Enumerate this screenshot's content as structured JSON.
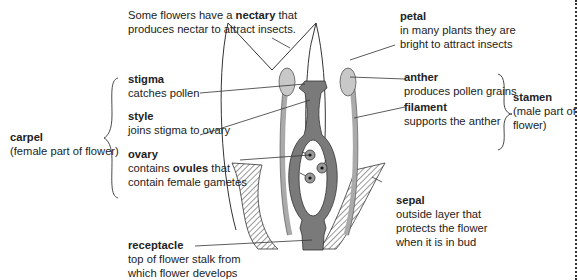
{
  "diagram": {
    "labels": {
      "nectary_note": {
        "pre": "Some flowers have a ",
        "bold": "nectary",
        "post": " that",
        "line2": "produces nectar to attract insects."
      },
      "petal": {
        "name": "petal",
        "desc1": "in many plants they are",
        "desc2": "bright to attract insects"
      },
      "stigma": {
        "name": "stigma",
        "desc": "catches pollen"
      },
      "style": {
        "name": "style",
        "desc": "joins stigma to ovary"
      },
      "carpel": {
        "name": "carpel",
        "desc": "(female part of flower)"
      },
      "ovary": {
        "name": "ovary",
        "desc_pre": "contains ",
        "desc_bold": "ovules",
        "desc_post": " that",
        "desc2": "contain female gametes"
      },
      "anther": {
        "name": "anther",
        "desc": "produces pollen grains"
      },
      "filament": {
        "name": "filament",
        "desc": "supports the anther"
      },
      "stamen": {
        "name": "stamen",
        "desc1": "(male part of",
        "desc2": "flower)"
      },
      "sepal": {
        "name": "sepal",
        "desc1": "outside layer that",
        "desc2": "protects the flower",
        "desc3": "when it is in bud"
      },
      "receptacle": {
        "name": "receptacle",
        "desc1": "top of flower stalk from",
        "desc2": "which flower develops"
      }
    },
    "colors": {
      "carpel_fill": "#7a7a7a",
      "anther_fill": "#c8c8c8",
      "sepal_hatch": "#555555",
      "line": "#333333"
    }
  }
}
